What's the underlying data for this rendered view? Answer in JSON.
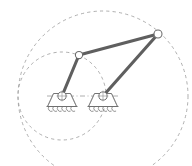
{
  "figure": {
    "type": "mechanism-schematic",
    "background_color": "#ffffff",
    "canvas": {
      "width": 192,
      "height": 166
    },
    "colors": {
      "link_stroke": "#5f5f5f",
      "joint_stroke": "#6a6a6a",
      "joint_fill": "#ffffff",
      "support_stroke": "#6f6f6f",
      "dashed_path_stroke": "#9a9a9a",
      "centerline_stroke": "#9a9a9a"
    },
    "joints": [
      {
        "id": "ground-pivot-left",
        "label": "",
        "x": 62,
        "y": 96,
        "radius": 4.1,
        "type": "fixed-pivot"
      },
      {
        "id": "ground-pivot-right",
        "label": "",
        "x": 103,
        "y": 96,
        "radius": 4.1,
        "type": "fixed-pivot"
      },
      {
        "id": "coupler-joint-left",
        "label": "",
        "x": 79,
        "y": 55,
        "radius": 3.6,
        "type": "revolute"
      },
      {
        "id": "coupler-joint-right",
        "label": "",
        "x": 158,
        "y": 34,
        "radius": 4.0,
        "type": "revolute"
      }
    ],
    "links": [
      {
        "id": "crank-left",
        "from": "ground-pivot-left",
        "to": "coupler-joint-left"
      },
      {
        "id": "crank-right",
        "from": "ground-pivot-right",
        "to": "coupler-joint-right"
      },
      {
        "id": "coupler-link",
        "from": "coupler-joint-left",
        "to": "coupler-joint-right"
      }
    ],
    "motion_paths": [
      {
        "id": "left-crank-circle",
        "center_x": 62,
        "center_y": 96,
        "radius": 44,
        "style": "dashed"
      },
      {
        "id": "right-crank-circle",
        "center_x": 103,
        "center_y": 96,
        "radius": 85,
        "style": "dashed"
      }
    ],
    "centerline": {
      "id": "ground-centerline",
      "x1": 47,
      "y1": 96,
      "x2": 120,
      "y2": 96,
      "style": "dash-dot"
    },
    "supports": [
      {
        "id": "support-left",
        "center_x": 62,
        "base_y": 106,
        "top_width": 17,
        "bottom_width": 29,
        "height": 13
      },
      {
        "id": "support-right",
        "center_x": 103,
        "base_y": 106,
        "top_width": 17,
        "bottom_width": 29,
        "height": 13
      }
    ]
  }
}
